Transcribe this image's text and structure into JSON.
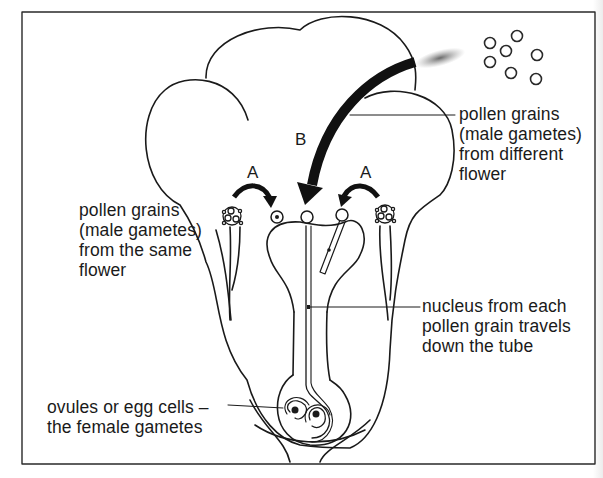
{
  "diagram": {
    "title": "",
    "type": "biology-pollination",
    "labels": {
      "same_flower": [
        "pollen grains",
        "(male gametes)",
        "from the same",
        "flower"
      ],
      "different_flower": [
        "pollen grains",
        "(male gametes)",
        "from different",
        "flower"
      ],
      "nucleus": [
        "nucleus from each",
        "pollen grain travels",
        "down the tube"
      ],
      "ovules": [
        "ovules or egg cells –",
        "the female gametes"
      ]
    },
    "arrow_letters": {
      "left_A": "A",
      "right_A": "A",
      "B": "B"
    },
    "colors": {
      "ink": "#1a1a1a",
      "background": "#ffffff",
      "frame": "#2a2a2a"
    }
  }
}
